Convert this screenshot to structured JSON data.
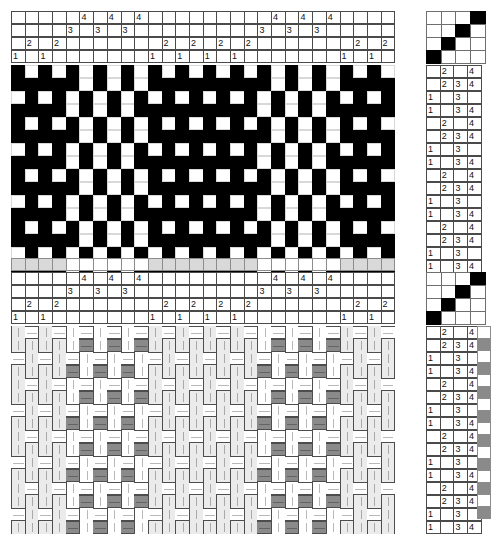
{
  "document": {
    "title": "Weaving draft — 4-shaft twill block pattern",
    "kind": "weaving-draft"
  },
  "shafts": 4,
  "treadles": 4,
  "threading": {
    "label": "Threading",
    "shaft_labels": [
      "1",
      "2",
      "3",
      "4"
    ],
    "warp_ends": 28,
    "sequence": [
      1,
      2,
      1,
      2,
      3,
      4,
      3,
      4,
      3,
      4,
      1,
      2,
      1,
      2,
      1,
      2,
      1,
      2,
      3,
      4,
      3,
      4,
      3,
      4,
      1,
      2,
      1,
      2
    ]
  },
  "tieup": {
    "label": "Tie-up",
    "rows": 4,
    "cols": 4,
    "filled": [
      [
        0,
        0,
        0,
        1
      ],
      [
        0,
        0,
        1,
        0
      ],
      [
        0,
        1,
        0,
        0
      ],
      [
        1,
        0,
        0,
        0
      ]
    ]
  },
  "treadling": {
    "label": "Treadling",
    "picks": 16,
    "rows": [
      {
        "labels": [
          "",
          "2",
          "",
          "4"
        ]
      },
      {
        "labels": [
          "",
          "2",
          "3",
          "4"
        ]
      },
      {
        "labels": [
          "1",
          "",
          "3",
          ""
        ]
      },
      {
        "labels": [
          "1",
          "",
          "3",
          "4"
        ]
      },
      {
        "labels": [
          "",
          "2",
          "",
          "4"
        ]
      },
      {
        "labels": [
          "",
          "2",
          "3",
          "4"
        ]
      },
      {
        "labels": [
          "1",
          "",
          "3",
          ""
        ]
      },
      {
        "labels": [
          "1",
          "",
          "3",
          "4"
        ]
      },
      {
        "labels": [
          "",
          "2",
          "",
          "4"
        ]
      },
      {
        "labels": [
          "",
          "2",
          "3",
          "4"
        ]
      },
      {
        "labels": [
          "1",
          "",
          "3",
          ""
        ]
      },
      {
        "labels": [
          "1",
          "",
          "3",
          "4"
        ]
      },
      {
        "labels": [
          "",
          "2",
          "",
          "4"
        ]
      },
      {
        "labels": [
          "",
          "2",
          "3",
          "4"
        ]
      },
      {
        "labels": [
          "1",
          "",
          "3",
          ""
        ]
      },
      {
        "labels": [
          "1",
          "",
          "3",
          "4"
        ]
      }
    ]
  },
  "colors": {
    "warp_dark": "#000000",
    "warp_light": "#ffffff",
    "grid_line": "#4a4a4a",
    "color_bar_light": "#ffffff",
    "color_bar_gray": "#d9d9d9",
    "fabric_warp_light": "#ebebeb",
    "fabric_warp_white": "#ffffff",
    "fabric_weft_gray": "#8a8a8a",
    "fabric_weft_white": "#ffffff"
  },
  "warp_color_bar": {
    "label": "Warp colour order",
    "values": [
      "g",
      "g",
      "g",
      "g",
      "w",
      "w",
      "w",
      "w",
      "w",
      "w",
      "g",
      "g",
      "g",
      "g",
      "g",
      "g",
      "g",
      "g",
      "w",
      "w",
      "w",
      "w",
      "w",
      "w",
      "g",
      "g",
      "g",
      "g"
    ]
  },
  "weft_color_bar": {
    "label": "Weft colour order",
    "values": [
      "w",
      "g",
      "w",
      "g",
      "w",
      "g",
      "w",
      "g",
      "w",
      "g",
      "w",
      "g",
      "w",
      "g",
      "w",
      "g"
    ]
  },
  "panels": {
    "top": {
      "name": "black-and-white drawdown",
      "threading_label": "Threading (top)",
      "drawdown_label": "Drawdown (black = warp up)"
    },
    "bottom": {
      "name": "colour fabric simulation",
      "threading_label": "Threading (bottom)",
      "drawdown_label": "Fabric simulation"
    }
  }
}
